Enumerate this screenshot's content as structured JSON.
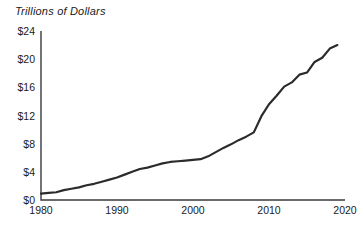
{
  "chart_data": {
    "type": "line",
    "title": "Trillions of Dollars",
    "xlabel": "",
    "ylabel": "",
    "grid": false,
    "legend": "none",
    "line_color": "#2b2b2b",
    "axis_color": "#3a3a3a",
    "xlim": [
      1980,
      2020
    ],
    "ylim": [
      0,
      24
    ],
    "ytick_labels": [
      "$0",
      "$4",
      "$8",
      "$12",
      "$16",
      "$20",
      "$24"
    ],
    "ytick_values": [
      0,
      4,
      8,
      12,
      16,
      20,
      24
    ],
    "xtick_labels": [
      "1980",
      "1990",
      "2000",
      "2010",
      "2020"
    ],
    "xtick_values": [
      1980,
      1990,
      2000,
      2010,
      2020
    ],
    "x": [
      1980,
      1981,
      1982,
      1983,
      1984,
      1985,
      1986,
      1987,
      1988,
      1989,
      1990,
      1991,
      1992,
      1993,
      1994,
      1995,
      1996,
      1997,
      1998,
      1999,
      2000,
      2001,
      2002,
      2003,
      2004,
      2005,
      2006,
      2007,
      2008,
      2009,
      2010,
      2011,
      2012,
      2013,
      2014,
      2015,
      2016,
      2017,
      2018,
      2019
    ],
    "values": [
      0.9,
      1.0,
      1.1,
      1.4,
      1.6,
      1.8,
      2.1,
      2.3,
      2.6,
      2.9,
      3.2,
      3.6,
      4.0,
      4.4,
      4.6,
      4.9,
      5.2,
      5.4,
      5.5,
      5.6,
      5.7,
      5.8,
      6.2,
      6.8,
      7.4,
      7.9,
      8.5,
      9.0,
      9.6,
      11.9,
      13.6,
      14.8,
      16.1,
      16.7,
      17.8,
      18.1,
      19.6,
      20.2,
      21.5,
      22.0
    ],
    "annotations": []
  }
}
